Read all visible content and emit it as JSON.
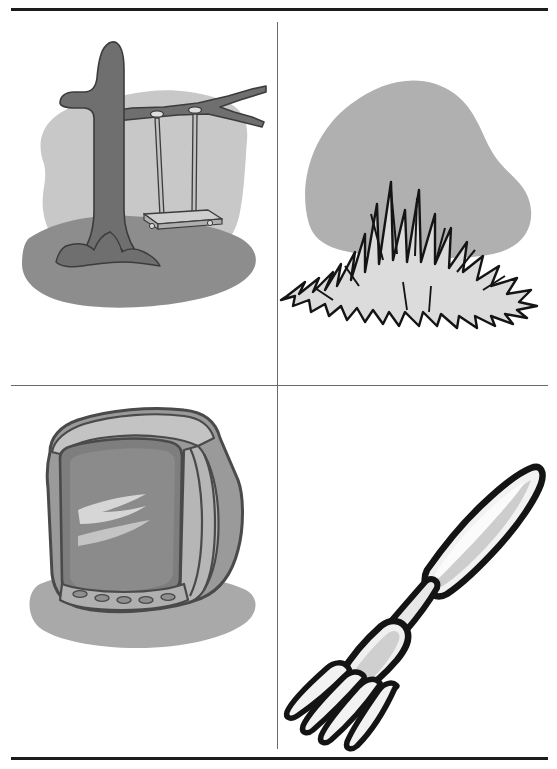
{
  "page": {
    "background_color": "#ffffff",
    "width": 557,
    "height": 769,
    "layout": "2x2 picture grid with ruled borders"
  },
  "rules": {
    "top_label": "top-border-rule",
    "bottom_label": "bottom-border-rule",
    "middle_label": "middle-horizontal-divider",
    "vertical_label": "vertical-divider",
    "dark_color": "#1c1c1c",
    "light_color": "#6a6a6a"
  },
  "palette": {
    "outline": "#1a1a1a",
    "sky_blob": "#c8c8c8",
    "ground_blob": "#8d8d8d",
    "tree_dark": "#6f6f6f",
    "tree_outline": "#3c3c3c",
    "bush_blob": "#b0b0b0",
    "grass_fill": "#dcdcdc",
    "tv_body": "#9a9a9a",
    "tv_body_light": "#c3c3c3",
    "tv_screen": "#8b8b8b",
    "tv_highlight": "#d6d6d6",
    "tv_shadow": "#a9a9a9",
    "fork_fill": "#f2f2f2",
    "fork_shade": "#b5b5b5",
    "swing_fill": "#c2c2c2",
    "white": "#ffffff"
  },
  "cells": [
    {
      "position": "top-left",
      "name": "tree-swing-picture",
      "subject": "tree swing",
      "description": "A bare tree with a rope swing hanging from a branch, on a gray ground mound with a lighter sky blob behind.",
      "elements": [
        "sky blob",
        "ground mound",
        "tree trunk",
        "branch",
        "swing ropes",
        "swing seat",
        "roots"
      ]
    },
    {
      "position": "top-right",
      "name": "grass-bush-picture",
      "subject": "grass",
      "description": "A spiky tuft of grass drawn with jagged black-outlined blades in front of a rounded gray bush or hill shape.",
      "elements": [
        "bush blob",
        "grass tuft",
        "grass blades"
      ]
    },
    {
      "position": "bottom-left",
      "name": "television-picture",
      "subject": "television",
      "description": "A boxy CRT television tilted at an angle with a gray screen, highlight streaks, a row of five oval buttons, and a shadow beneath.",
      "elements": [
        "shadow blob",
        "tv cabinet",
        "screen",
        "screen highlight",
        "button panel",
        "buttons"
      ]
    },
    {
      "position": "bottom-right",
      "name": "fork-picture",
      "subject": "fork",
      "description": "A table fork angled from lower left to upper right, with four curved tines, a bent neck, and a rounded handle.",
      "elements": [
        "tines",
        "fork head",
        "neck",
        "handle"
      ]
    }
  ]
}
